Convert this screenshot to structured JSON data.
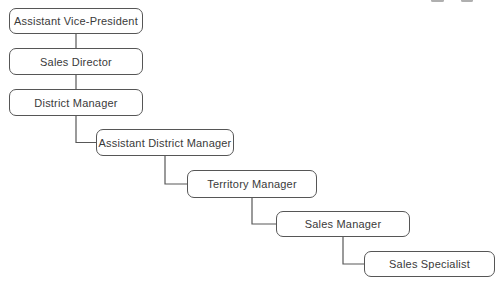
{
  "diagram": {
    "type": "org-chart-cascade",
    "background_color": "#ffffff",
    "box_fill_color": "#ffffff",
    "box_border_color": "#565656",
    "text_color": "#3a3a3a",
    "connector_color": "#585858",
    "nodes": [
      {
        "label": "Assistant Vice-President"
      },
      {
        "label": "Sales Director"
      },
      {
        "label": "District Manager"
      },
      {
        "label": "Assistant District Manager"
      },
      {
        "label": "Territory Manager"
      },
      {
        "label": "Sales Manager"
      },
      {
        "label": "Sales Specialist"
      }
    ],
    "edges": [
      [
        0,
        1
      ],
      [
        1,
        2
      ],
      [
        2,
        3
      ],
      [
        3,
        4
      ],
      [
        4,
        5
      ],
      [
        5,
        6
      ]
    ],
    "hierarchy_note": "Each node reports to the one above it; subordinate boxes step down-right"
  }
}
